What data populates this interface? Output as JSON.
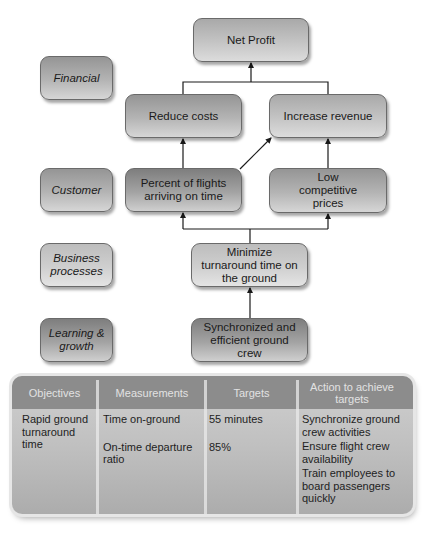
{
  "diagram": {
    "perspectives": [
      {
        "id": "financial",
        "label": "Financial"
      },
      {
        "id": "customer",
        "label": "Customer"
      },
      {
        "id": "business-processes",
        "label": "Business processes"
      },
      {
        "id": "learning-growth",
        "label": "Learning & growth"
      }
    ],
    "nodes": {
      "net_profit": "Net Profit",
      "reduce_costs": "Reduce costs",
      "increase_revenue": "Increase revenue",
      "on_time_flights": "Percent of flights arriving on time",
      "low_prices": "Low competitive prices",
      "minimize_turnaround": "Minimize turnaround time on the ground",
      "ground_crew": "Synchronized and efficient ground crew"
    },
    "edges": [
      {
        "from": "reduce_costs",
        "to": "net_profit"
      },
      {
        "from": "increase_revenue",
        "to": "net_profit"
      },
      {
        "from": "on_time_flights",
        "to": "reduce_costs"
      },
      {
        "from": "on_time_flights",
        "to": "increase_revenue"
      },
      {
        "from": "low_prices",
        "to": "increase_revenue"
      },
      {
        "from": "minimize_turnaround",
        "to": "on_time_flights"
      },
      {
        "from": "minimize_turnaround",
        "to": "low_prices"
      },
      {
        "from": "ground_crew",
        "to": "minimize_turnaround"
      }
    ]
  },
  "table": {
    "headers": [
      "Objectives",
      "Measurements",
      "Targets",
      "Action to achieve targets"
    ],
    "objectives": [
      "Rapid ground turnaround time"
    ],
    "measurements": [
      "Time on-ground",
      "On-time departure ratio"
    ],
    "targets": [
      "55 minutes",
      "85%"
    ],
    "actions": [
      "Synchronize ground crew activities",
      "Ensure flight crew availability",
      "Train employees to board passengers quickly"
    ]
  },
  "colors": {
    "line": "#1a1a1a",
    "header_bg": "#8c8c8c",
    "header_text": "#e2e2e2"
  }
}
